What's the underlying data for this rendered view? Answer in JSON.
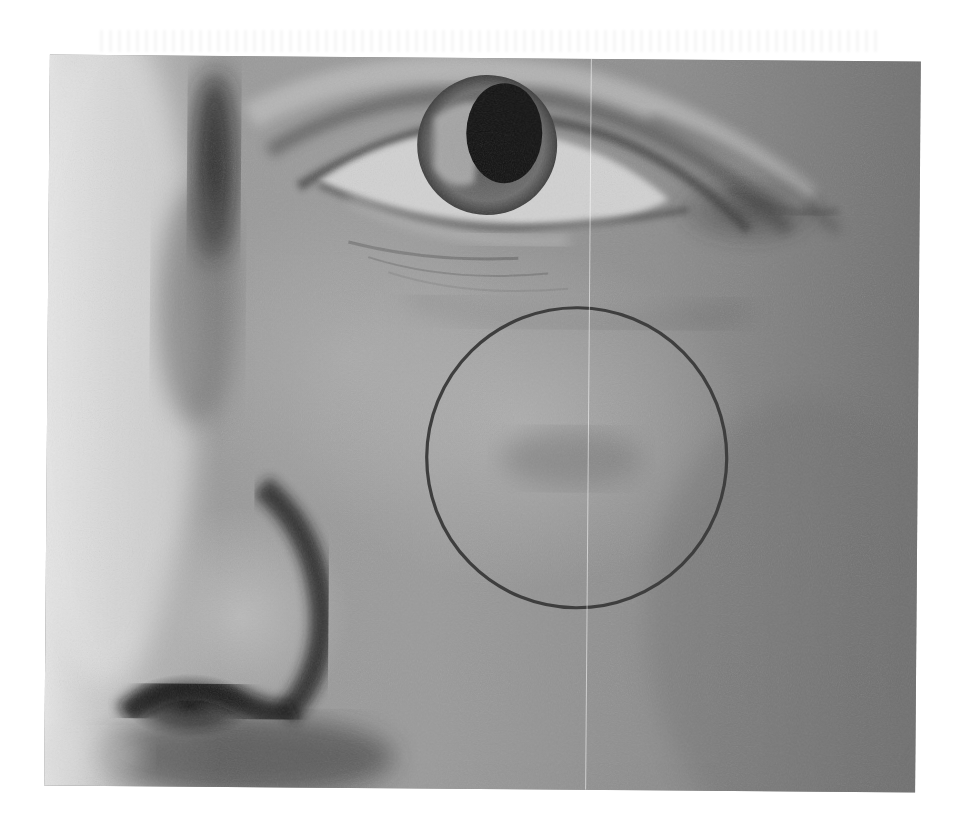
{
  "figure": {
    "annotation": {
      "type": "circle",
      "label": "highlighted cheek region",
      "center": [
        577,
        457
      ],
      "radius": 150,
      "stroke_color": "#3e3e3e",
      "stroke_width": 3
    },
    "colors": {
      "background": "#ffffff",
      "skin_mid": "#8a8a8a",
      "skin_dark": "#6e6e6e",
      "skin_light": "#e0e0e0",
      "shadow": "#151515"
    }
  }
}
